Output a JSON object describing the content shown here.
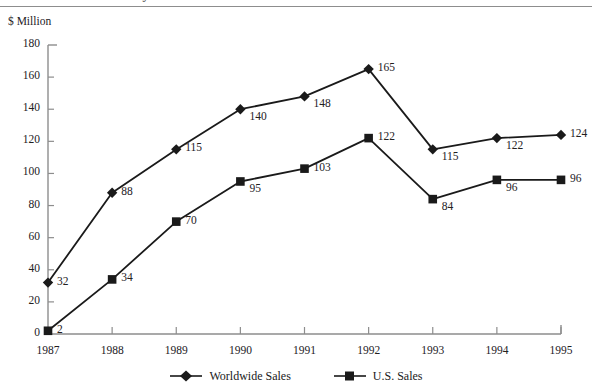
{
  "header": {
    "clipped_title": "… … … …ectivity",
    "rule_color": "#8d8d8d"
  },
  "axis_unit_label": "$ Million",
  "legend": {
    "items": [
      {
        "label": "Worldwide Sales",
        "marker": "diamond",
        "color": "#1a1a1a"
      },
      {
        "label": "U.S. Sales",
        "marker": "square",
        "color": "#1a1a1a"
      }
    ]
  },
  "chart_data": {
    "type": "line",
    "title": "",
    "xlabel": "",
    "ylabel": "$ Million",
    "grid": false,
    "legend_position": "bottom",
    "categories": [
      "1987",
      "1988",
      "1989",
      "1990",
      "1991",
      "1992",
      "1993",
      "1994",
      "1995"
    ],
    "x": [
      1987,
      1988,
      1989,
      1990,
      1991,
      1992,
      1993,
      1994,
      1995
    ],
    "ylim": [
      0,
      180
    ],
    "yticks": [
      0,
      20,
      40,
      60,
      80,
      100,
      120,
      140,
      160,
      180
    ],
    "series": [
      {
        "name": "Worldwide Sales",
        "marker": "diamond",
        "color": "#1a1a1a",
        "values": [
          32,
          88,
          115,
          140,
          148,
          165,
          115,
          122,
          124
        ],
        "labels": [
          "32",
          "88",
          "115",
          "140",
          "148",
          "165",
          "115",
          "122",
          "124"
        ]
      },
      {
        "name": "U.S. Sales",
        "marker": "square",
        "color": "#1a1a1a",
        "values": [
          2,
          34,
          70,
          95,
          103,
          122,
          84,
          96,
          96
        ],
        "labels": [
          "2",
          "34",
          "70",
          "95",
          "103",
          "122",
          "84",
          "96",
          "96"
        ]
      }
    ]
  }
}
